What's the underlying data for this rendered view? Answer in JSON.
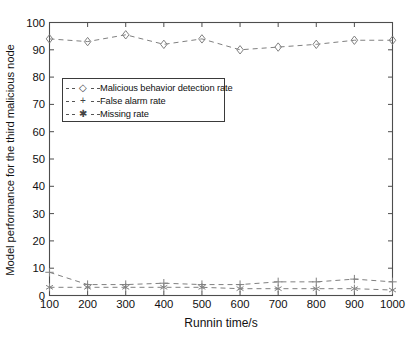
{
  "figure": {
    "background_color": "#ffffff",
    "axes_color": "#4d4d4d",
    "series_color": "#808080"
  },
  "axis": {
    "x": {
      "label": "Runnin time/s",
      "ticks": [
        "100",
        "200",
        "300",
        "400",
        "500",
        "600",
        "700",
        "800",
        "900",
        "1000"
      ],
      "min": 100,
      "max": 1000
    },
    "y": {
      "label": "Model performance for the third malicious node",
      "ticks": [
        "0",
        "10",
        "20",
        "30",
        "40",
        "50",
        "60",
        "70",
        "80",
        "90",
        "100"
      ],
      "min": 0,
      "max": 100
    }
  },
  "legend": {
    "position": "upper-left-inset",
    "items": [
      {
        "label": "Malicious behavior detection rate",
        "marker": "diamond-icon",
        "marker_glyph": "◇",
        "linestyle": "dashed"
      },
      {
        "label": "False alarm rate",
        "marker": "plus-icon",
        "marker_glyph": "+",
        "linestyle": "dashed"
      },
      {
        "label": "Missing rate",
        "marker": "asterisk-icon",
        "marker_glyph": "✱",
        "linestyle": "dashed"
      }
    ]
  },
  "chart_data": {
    "type": "line",
    "title": "",
    "xlabel": "Runnin time/s",
    "ylabel": "Model performance for the third malicious node",
    "x": [
      100,
      200,
      300,
      400,
      500,
      600,
      700,
      800,
      900,
      1000
    ],
    "xlim": [
      100,
      1000
    ],
    "ylim": [
      0,
      100
    ],
    "grid": false,
    "legend_position": "upper-left-inset",
    "series": [
      {
        "name": "Malicious behavior detection rate",
        "marker": "diamond",
        "linestyle": "dashed",
        "values": [
          94,
          93,
          95.5,
          92,
          94,
          90,
          91,
          92,
          93.5,
          93.5
        ]
      },
      {
        "name": "False alarm rate",
        "marker": "plus",
        "linestyle": "dashed",
        "values": [
          8.5,
          4,
          4,
          4.5,
          4,
          4,
          5,
          5,
          6,
          5
        ]
      },
      {
        "name": "Missing rate",
        "marker": "asterisk",
        "linestyle": "dashed",
        "values": [
          3,
          3,
          3,
          3,
          3,
          2.5,
          2.5,
          2.5,
          2.5,
          2
        ]
      }
    ]
  }
}
